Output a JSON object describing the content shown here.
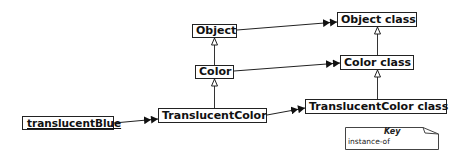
{
  "diagram": {
    "nodes": {
      "object": "Object",
      "color": "Color",
      "translucent_color": "TranslucentColor",
      "translucent_blue": "translucentBlue",
      "object_class": "Object class",
      "color_class": "Color class",
      "translucent_color_class": "TranslucentColor class"
    },
    "edges": [
      {
        "from": "Color",
        "to": "Object",
        "type": "inherits"
      },
      {
        "from": "TranslucentColor",
        "to": "Color",
        "type": "inherits"
      },
      {
        "from": "Color class",
        "to": "Object class",
        "type": "inherits"
      },
      {
        "from": "TranslucentColor class",
        "to": "Color class",
        "type": "inherits"
      },
      {
        "from": "translucentBlue",
        "to": "TranslucentColor",
        "type": "instance-of"
      },
      {
        "from": "TranslucentColor",
        "to": "TranslucentColor class",
        "type": "instance-of"
      },
      {
        "from": "Color",
        "to": "Color class",
        "type": "instance-of"
      },
      {
        "from": "Object",
        "to": "Object class",
        "type": "instance-of"
      }
    ],
    "key": {
      "title": "Key",
      "entries": [
        {
          "label": "instance-of",
          "symbol": "double-arrowhead"
        }
      ]
    }
  }
}
